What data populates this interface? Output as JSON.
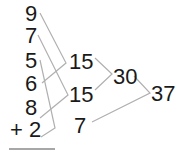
{
  "addends": [
    {
      "id": "a1",
      "label": "9",
      "x": 25,
      "y": 3
    },
    {
      "id": "a2",
      "label": "7",
      "x": 25,
      "y": 25
    },
    {
      "id": "a3",
      "label": "5",
      "x": 25,
      "y": 50
    },
    {
      "id": "a4",
      "label": "6",
      "x": 25,
      "y": 73
    },
    {
      "id": "a5",
      "label": "8",
      "x": 25,
      "y": 97
    },
    {
      "id": "a6",
      "label": "+ 2",
      "x": 10,
      "y": 119
    }
  ],
  "partial_sums": [
    {
      "id": "s1",
      "label": "15",
      "x": 69,
      "y": 51,
      "from": [
        "9",
        "6"
      ]
    },
    {
      "id": "s2",
      "label": "15",
      "x": 69,
      "y": 84,
      "from": [
        "7",
        "8"
      ]
    },
    {
      "id": "s3",
      "label": "7",
      "x": 74,
      "y": 115,
      "from": [
        "5",
        "2"
      ]
    },
    {
      "id": "s4",
      "label": "30",
      "x": 113,
      "y": 66,
      "from": [
        "15",
        "15"
      ]
    },
    {
      "id": "s5",
      "label": "37",
      "x": 151,
      "y": 83,
      "from": [
        "30",
        "7"
      ]
    }
  ],
  "line_color": "#b0b0b0",
  "underline_color": "#8a8a8a"
}
